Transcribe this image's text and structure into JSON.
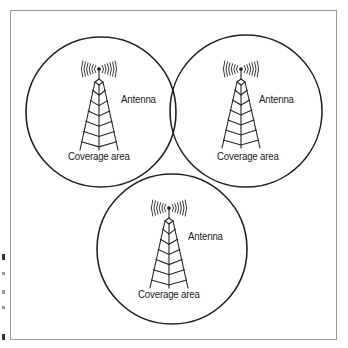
{
  "diagram": {
    "type": "cellular-coverage-overlap",
    "colors": {
      "stroke": "#222222",
      "frame": "#9a9a9a",
      "background": "#ffffff"
    },
    "cells": [
      {
        "id": "cell-top-left",
        "circle": {
          "cx": 101,
          "cy": 112,
          "r": 75
        },
        "tower": {
          "x": 99,
          "top": 73,
          "base": 150,
          "half_width": 19
        },
        "antenna_label": "Antenna",
        "antenna_label_pos": {
          "x": 121,
          "y": 101
        },
        "coverage_label": "Coverage area",
        "coverage_label_pos": {
          "x": 68,
          "y": 158
        },
        "icon": "radio-tower-icon"
      },
      {
        "id": "cell-top-right",
        "circle": {
          "cx": 246,
          "cy": 111,
          "r": 76
        },
        "tower": {
          "x": 241,
          "top": 73,
          "base": 148,
          "half_width": 19
        },
        "antenna_label": "Antenna",
        "antenna_label_pos": {
          "x": 259,
          "y": 101
        },
        "coverage_label": "Coverage area",
        "coverage_label_pos": {
          "x": 217,
          "y": 158
        },
        "icon": "radio-tower-icon"
      },
      {
        "id": "cell-bottom",
        "circle": {
          "cx": 172,
          "cy": 249,
          "r": 75
        },
        "tower": {
          "x": 169,
          "top": 212,
          "base": 288,
          "half_width": 19
        },
        "antenna_label": "Antenna",
        "antenna_label_pos": {
          "x": 188,
          "y": 238
        },
        "coverage_label": "Coverage area",
        "coverage_label_pos": {
          "x": 138,
          "y": 296
        },
        "icon": "radio-tower-icon"
      }
    ]
  }
}
